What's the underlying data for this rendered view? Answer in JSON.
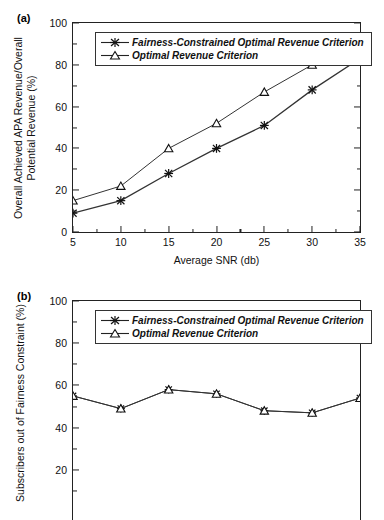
{
  "figure": {
    "panels": [
      {
        "label": "(a)",
        "ylabel": "Overall Achieved APA Revenue/Overall\nPotential Revenue (%)",
        "xlabel": "Average SNR (db)",
        "legend": [
          "Fairness-Constrained Optimal Revenue Criterion",
          "Optimal Revenue Criterion"
        ]
      },
      {
        "label": "(b)",
        "ylabel": "Subscribers out of Fairness Constraint (%)",
        "xlabel": "",
        "legend": [
          "Fairness-Constrained Optimal Revenue Criterion",
          "Optimal Revenue Criterion"
        ]
      }
    ]
  },
  "chart_data": [
    {
      "type": "line",
      "panel": "(a)",
      "title": "",
      "xlabel": "Average SNR (db)",
      "ylabel": "Overall Achieved APA Revenue/Overall Potential Revenue (%)",
      "x": [
        5,
        10,
        15,
        20,
        25,
        30,
        35
      ],
      "xticks": [
        5,
        10,
        15,
        20,
        25,
        30,
        35
      ],
      "yticks": [
        0,
        20,
        40,
        60,
        80,
        100
      ],
      "xlim": [
        5,
        35
      ],
      "ylim": [
        0,
        100
      ],
      "grid": false,
      "legend_position": "top-left",
      "series": [
        {
          "name": "Fairness-Constrained Optimal Revenue Criterion",
          "marker": "star",
          "values": [
            9,
            15,
            28,
            40,
            51,
            68,
            83
          ]
        },
        {
          "name": "Optimal Revenue Criterion",
          "marker": "triangle",
          "values": [
            15,
            22,
            40,
            52,
            67,
            80,
            86
          ]
        }
      ]
    },
    {
      "type": "line",
      "panel": "(b)",
      "title": "",
      "xlabel": "",
      "ylabel": "Subscribers out of Fairness Constraint (%)",
      "x": [
        5,
        10,
        15,
        20,
        25,
        30,
        35
      ],
      "xticks": [
        5,
        10,
        15,
        20,
        25,
        30,
        35
      ],
      "yticks": [
        20,
        40,
        60,
        80,
        100
      ],
      "xlim": [
        5,
        35
      ],
      "ylim": [
        0,
        100
      ],
      "grid": false,
      "legend_position": "top-left",
      "note": "axis cropped at bottom of image",
      "series": [
        {
          "name": "Fairness-Constrained Optimal Revenue Criterion",
          "marker": "star",
          "values": [
            55,
            49,
            58,
            56,
            48,
            47,
            54
          ]
        },
        {
          "name": "Optimal Revenue Criterion",
          "marker": "triangle",
          "values": [
            55,
            49,
            58,
            56,
            48,
            47,
            54
          ]
        }
      ]
    }
  ],
  "style": {
    "line_color": "#333333",
    "axis_color": "#222222",
    "background": "#ffffff"
  }
}
